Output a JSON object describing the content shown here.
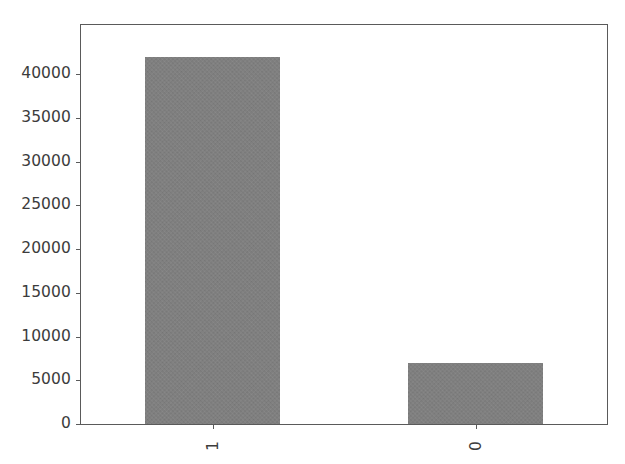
{
  "chart_data": {
    "type": "bar",
    "title": "",
    "subtitle": "",
    "xlabel": "",
    "ylabel": "",
    "categories": [
      "1",
      "0"
    ],
    "values": [
      42000,
      7000
    ],
    "series": [
      {
        "name": "count",
        "values": [
          42000,
          7000
        ]
      }
    ],
    "ylim": [
      0,
      45600
    ],
    "xlim": [
      0,
      2
    ],
    "yticks": [
      0,
      5000,
      10000,
      15000,
      20000,
      25000,
      30000,
      35000,
      40000
    ],
    "ytick_labels": [
      "0",
      "5000",
      "10000",
      "15000",
      "20000",
      "25000",
      "30000",
      "35000",
      "40000"
    ],
    "xtick_labels": [
      "1",
      "0"
    ],
    "xtick_label_rotation": 90,
    "grid": false,
    "legend": null,
    "legend_position": "none",
    "bar_color": "#7f7f7f",
    "axis_color": "#5a5a5a",
    "tick_label_color": "#3c3c3c",
    "background_color": "#ffffff",
    "bar_width_fraction": 0.51
  },
  "figure": {
    "background_color": "#ffffff",
    "width": 625,
    "height": 464
  }
}
